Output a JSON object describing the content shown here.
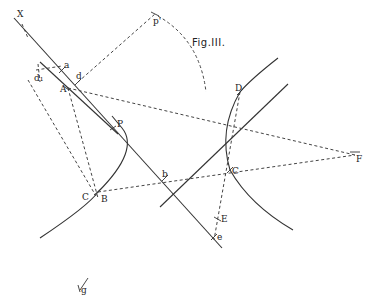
{
  "figure": {
    "title": "Fig.III.",
    "labels": {
      "X": "X",
      "a": "a",
      "d1": "d₁",
      "d": "d",
      "A": "A",
      "P": "P",
      "C_left": "C",
      "B": "B",
      "b": "b",
      "D": "D",
      "C_right": "C",
      "F": "F",
      "E": "E",
      "e": "e",
      "p_prime": "p'",
      "g": "g"
    }
  },
  "colors": {
    "ink": "#333333",
    "background": "#ffffff"
  }
}
